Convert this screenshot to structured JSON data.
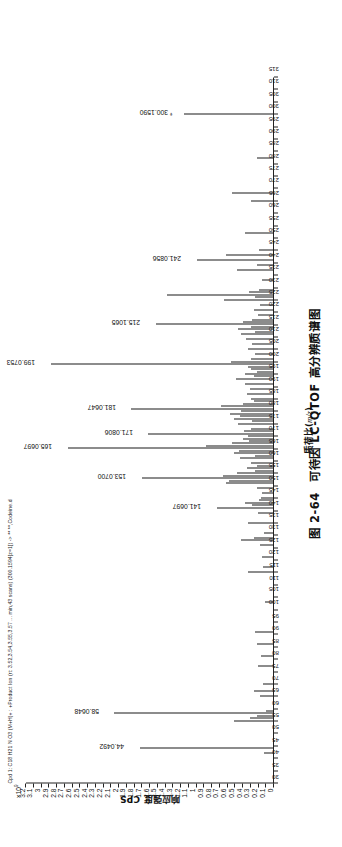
{
  "header": {
    "sample_info": "Cpd 1: C18 H21 N O3 (M+H)+ : +Product Ion (rt: 3.52,3.54,3.55,3.57 ... min,43 scans) (300.1594[z=1]) -> ** **,Codeine.d"
  },
  "caption": {
    "number": "图 2-64",
    "text": "可待因 LC-QTOF 高分辨质谱图"
  },
  "chart_data": {
    "type": "bar",
    "title": "可待因 LC-QTOF 高分辨质谱图",
    "xlabel": "质荷比(m/z)",
    "ylabel": "响应强度 CPS",
    "y_multiplier": "×10",
    "y_multiplier_exp": "9",
    "xlim": [
      30,
      315
    ],
    "ylim": [
      0,
      3.2
    ],
    "grid": false,
    "legend": "none",
    "xticks": [
      30,
      35,
      40,
      45,
      50,
      55,
      60,
      65,
      70,
      75,
      80,
      85,
      90,
      95,
      100,
      105,
      110,
      115,
      120,
      125,
      130,
      135,
      140,
      145,
      150,
      155,
      160,
      165,
      170,
      175,
      180,
      185,
      190,
      195,
      200,
      205,
      210,
      215,
      220,
      225,
      230,
      235,
      240,
      245,
      250,
      255,
      260,
      265,
      270,
      275,
      280,
      285,
      290,
      295,
      300,
      305,
      310,
      315
    ],
    "yticks": [
      0,
      0.1,
      0.2,
      0.3,
      0.4,
      0.5,
      0.6,
      0.7,
      0.8,
      0.9,
      1,
      1.1,
      1.2,
      1.3,
      1.4,
      1.5,
      1.6,
      1.7,
      1.8,
      1.9,
      2,
      2.1,
      2.2,
      2.3,
      2.4,
      2.5,
      2.6,
      2.7,
      2.8,
      2.9,
      3,
      3.1,
      3.2
    ],
    "ytick_labels": [
      "0",
      "0.1",
      "0.2",
      "0.3",
      "0.4",
      "0.5",
      "0.6",
      "0.7",
      "0.8",
      "0.9",
      "1",
      "1.1",
      "1.2",
      "1.3",
      "1.4",
      "1.5",
      "1.6",
      "1.7",
      "1.8",
      "1.9",
      "2",
      "2.1",
      "2.2",
      "2.3",
      "2.4",
      "2.5",
      "2.6",
      "2.7",
      "2.8",
      "2.9",
      "3",
      "3.1",
      "3.2"
    ],
    "labeled_peaks": [
      {
        "mz": 44.0492,
        "intensity": 1.73,
        "label": "44.0492"
      },
      {
        "mz": 58.0648,
        "intensity": 2.06,
        "label": "58.0648"
      },
      {
        "mz": 141.0697,
        "intensity": 0.74,
        "label": "141.0697"
      },
      {
        "mz": 153.07,
        "intensity": 1.7,
        "label": "153.0700"
      },
      {
        "mz": 165.0697,
        "intensity": 2.66,
        "label": "165.0697"
      },
      {
        "mz": 171.0806,
        "intensity": 1.62,
        "label": "171.0806"
      },
      {
        "mz": 181.0647,
        "intensity": 1.84,
        "label": "181.0647"
      },
      {
        "mz": 199.0753,
        "intensity": 2.88,
        "label": "199.0753"
      },
      {
        "mz": 215.1065,
        "intensity": 1.52,
        "label": "215.1065"
      },
      {
        "mz": 241.0856,
        "intensity": 1.0,
        "label": "241.0856"
      },
      {
        "mz": 300.159,
        "intensity": 1.16,
        "label": "300.1590",
        "marker": "*"
      }
    ],
    "peaks": [
      {
        "mz": 42.03,
        "intensity": 0.13
      },
      {
        "mz": 44.0492,
        "intensity": 1.73
      },
      {
        "mz": 55.05,
        "intensity": 0.52
      },
      {
        "mz": 56.05,
        "intensity": 0.31
      },
      {
        "mz": 57.07,
        "intensity": 0.22
      },
      {
        "mz": 58.0648,
        "intensity": 2.06
      },
      {
        "mz": 59.07,
        "intensity": 0.1
      },
      {
        "mz": 65.04,
        "intensity": 0.18
      },
      {
        "mz": 67.05,
        "intensity": 0.26
      },
      {
        "mz": 70.07,
        "intensity": 0.14
      },
      {
        "mz": 77.04,
        "intensity": 0.21
      },
      {
        "mz": 81.07,
        "intensity": 0.17
      },
      {
        "mz": 86.1,
        "intensity": 0.22
      },
      {
        "mz": 91.05,
        "intensity": 0.24
      },
      {
        "mz": 103.05,
        "intensity": 0.12
      },
      {
        "mz": 115.05,
        "intensity": 0.34
      },
      {
        "mz": 117.07,
        "intensity": 0.14
      },
      {
        "mz": 121.06,
        "intensity": 0.16
      },
      {
        "mz": 126.05,
        "intensity": 0.18
      },
      {
        "mz": 128.06,
        "intensity": 0.42
      },
      {
        "mz": 129.07,
        "intensity": 0.26
      },
      {
        "mz": 131.05,
        "intensity": 0.13
      },
      {
        "mz": 135.08,
        "intensity": 0.33
      },
      {
        "mz": 139.05,
        "intensity": 0.21
      },
      {
        "mz": 141.0697,
        "intensity": 0.74
      },
      {
        "mz": 142.07,
        "intensity": 0.29
      },
      {
        "mz": 143.09,
        "intensity": 0.38
      },
      {
        "mz": 144.08,
        "intensity": 0.19
      },
      {
        "mz": 145.06,
        "intensity": 0.17
      },
      {
        "mz": 147.08,
        "intensity": 0.15
      },
      {
        "mz": 149.06,
        "intensity": 0.22
      },
      {
        "mz": 151.05,
        "intensity": 0.62
      },
      {
        "mz": 152.06,
        "intensity": 0.58
      },
      {
        "mz": 153.07,
        "intensity": 1.7
      },
      {
        "mz": 154.08,
        "intensity": 0.66
      },
      {
        "mz": 155.09,
        "intensity": 0.48
      },
      {
        "mz": 156.08,
        "intensity": 0.25
      },
      {
        "mz": 157.06,
        "intensity": 0.35
      },
      {
        "mz": 158.07,
        "intensity": 0.22
      },
      {
        "mz": 159.08,
        "intensity": 0.3
      },
      {
        "mz": 161.06,
        "intensity": 0.44
      },
      {
        "mz": 162.07,
        "intensity": 0.24
      },
      {
        "mz": 163.05,
        "intensity": 0.52
      },
      {
        "mz": 164.06,
        "intensity": 0.45
      },
      {
        "mz": 165.0697,
        "intensity": 2.66
      },
      {
        "mz": 166.08,
        "intensity": 0.88
      },
      {
        "mz": 167.09,
        "intensity": 0.54
      },
      {
        "mz": 168.08,
        "intensity": 0.32
      },
      {
        "mz": 169.06,
        "intensity": 0.4
      },
      {
        "mz": 170.07,
        "intensity": 0.33
      },
      {
        "mz": 171.0806,
        "intensity": 1.62
      },
      {
        "mz": 172.09,
        "intensity": 0.39
      },
      {
        "mz": 173.1,
        "intensity": 0.3
      },
      {
        "mz": 175.07,
        "intensity": 0.46
      },
      {
        "mz": 176.08,
        "intensity": 0.29
      },
      {
        "mz": 177.07,
        "intensity": 0.51
      },
      {
        "mz": 178.08,
        "intensity": 0.44
      },
      {
        "mz": 179.09,
        "intensity": 0.57
      },
      {
        "mz": 180.08,
        "intensity": 0.43
      },
      {
        "mz": 181.0647,
        "intensity": 1.84
      },
      {
        "mz": 182.07,
        "intensity": 0.68
      },
      {
        "mz": 183.08,
        "intensity": 0.4
      },
      {
        "mz": 184.09,
        "intensity": 0.26
      },
      {
        "mz": 185.1,
        "intensity": 0.3
      },
      {
        "mz": 187.08,
        "intensity": 0.35
      },
      {
        "mz": 189.07,
        "intensity": 0.31
      },
      {
        "mz": 191.09,
        "intensity": 0.38
      },
      {
        "mz": 193.08,
        "intensity": 0.49
      },
      {
        "mz": 194.1,
        "intensity": 0.26
      },
      {
        "mz": 195.08,
        "intensity": 0.37
      },
      {
        "mz": 196.09,
        "intensity": 0.22
      },
      {
        "mz": 197.06,
        "intensity": 0.3
      },
      {
        "mz": 198.07,
        "intensity": 0.34
      },
      {
        "mz": 199.0753,
        "intensity": 2.88
      },
      {
        "mz": 200.08,
        "intensity": 0.56
      },
      {
        "mz": 201.09,
        "intensity": 0.3
      },
      {
        "mz": 203.08,
        "intensity": 0.24
      },
      {
        "mz": 205.09,
        "intensity": 0.33
      },
      {
        "mz": 207.08,
        "intensity": 0.29
      },
      {
        "mz": 209.1,
        "intensity": 0.36
      },
      {
        "mz": 211.08,
        "intensity": 0.42
      },
      {
        "mz": 212.09,
        "intensity": 0.25
      },
      {
        "mz": 213.09,
        "intensity": 0.47
      },
      {
        "mz": 214.1,
        "intensity": 0.3
      },
      {
        "mz": 215.1065,
        "intensity": 1.52
      },
      {
        "mz": 216.11,
        "intensity": 0.4
      },
      {
        "mz": 217.09,
        "intensity": 0.28
      },
      {
        "mz": 219.08,
        "intensity": 0.21
      },
      {
        "mz": 221.1,
        "intensity": 0.26
      },
      {
        "mz": 223.09,
        "intensity": 0.18
      },
      {
        "mz": 225.11,
        "intensity": 0.64
      },
      {
        "mz": 226.1,
        "intensity": 0.24
      },
      {
        "mz": 227.1,
        "intensity": 1.38
      },
      {
        "mz": 228.11,
        "intensity": 0.32
      },
      {
        "mz": 229.09,
        "intensity": 0.2
      },
      {
        "mz": 233.08,
        "intensity": 0.16
      },
      {
        "mz": 237.09,
        "intensity": 0.48
      },
      {
        "mz": 239.11,
        "intensity": 0.22
      },
      {
        "mz": 241.0856,
        "intensity": 1.0
      },
      {
        "mz": 243.1,
        "intensity": 0.62
      },
      {
        "mz": 245.1,
        "intensity": 0.19
      },
      {
        "mz": 252.1,
        "intensity": 0.38
      },
      {
        "mz": 265.12,
        "intensity": 0.3
      },
      {
        "mz": 268.13,
        "intensity": 0.54
      },
      {
        "mz": 282.14,
        "intensity": 0.22
      },
      {
        "mz": 300.159,
        "intensity": 1.16
      }
    ]
  }
}
